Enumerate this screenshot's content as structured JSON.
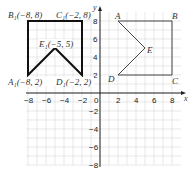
{
  "diagram": {
    "type": "coordinate-grid",
    "axes": {
      "x_label": "x",
      "y_label": "y",
      "x_range": [
        -8,
        8
      ],
      "y_range": [
        -8,
        8
      ],
      "x_ticks": [
        "−8",
        "−6",
        "−4",
        "−2",
        "0",
        "2",
        "4",
        "6",
        "8"
      ],
      "y_ticks": [
        "8",
        "6",
        "4",
        "2",
        "−2",
        "−4",
        "−6",
        "−8"
      ]
    },
    "shape_original": {
      "vertices": [
        {
          "name": "A",
          "x": 2,
          "y": 8
        },
        {
          "name": "B",
          "x": 8,
          "y": 8
        },
        {
          "name": "C",
          "x": 8,
          "y": 2
        },
        {
          "name": "D",
          "x": 2,
          "y": 2
        },
        {
          "name": "E",
          "x": 5,
          "y": 5
        }
      ],
      "labels": {
        "A": "A",
        "B": "B",
        "C": "C",
        "D": "D",
        "E": "E"
      }
    },
    "shape_image": {
      "vertices": [
        {
          "name": "A1",
          "x": -8,
          "y": 2
        },
        {
          "name": "B1",
          "x": -8,
          "y": 8
        },
        {
          "name": "C1",
          "x": -2,
          "y": 8
        },
        {
          "name": "D1",
          "x": -2,
          "y": 2
        },
        {
          "name": "E1",
          "x": -5,
          "y": 5
        }
      ],
      "labels": {
        "A1": "A₁(−8, 2)",
        "B1": "B₁(−8, 8)",
        "C1": "C₁(−2, 8)",
        "D1": "D₁(−2, 2)",
        "E1": "E₁(−5, 5)"
      }
    }
  }
}
